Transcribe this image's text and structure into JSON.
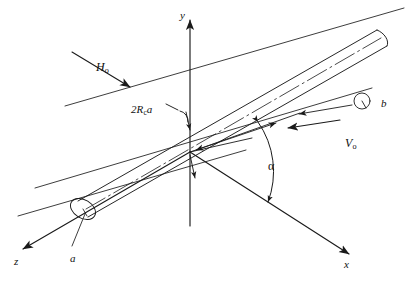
{
  "figure": {
    "type": "3d-technical-diagram",
    "background_color": "#ffffff",
    "line_color": "#1a1a1a",
    "width": 413,
    "height": 282
  },
  "axes": [
    {
      "id": "y",
      "label": "y",
      "direction": "up",
      "label_x": 180,
      "label_y": 10
    },
    {
      "id": "x",
      "label": "x",
      "direction": "lower-right",
      "label_x": 344,
      "label_y": 259
    },
    {
      "id": "z",
      "label": "z",
      "direction": "lower-left",
      "label_x": 14,
      "label_y": 256
    }
  ],
  "vectors": [
    {
      "id": "H0",
      "base": "H",
      "sub": "o",
      "label_x": 96,
      "label_y": 61
    },
    {
      "id": "V0",
      "base": "V",
      "sub": "o",
      "label_x": 345,
      "label_y": 137
    }
  ],
  "annotations": [
    {
      "id": "radius-a",
      "text": "a",
      "label_x": 70,
      "label_y": 253
    },
    {
      "id": "radius-b",
      "text": "b",
      "label_x": 381,
      "label_y": 98
    },
    {
      "id": "angle-alpha",
      "text": "α",
      "label_x": 268,
      "label_y": 160
    }
  ],
  "dimension": {
    "id": "core-diameter",
    "prefix": "2R",
    "sub": "c",
    "suffix": "a",
    "label_x": 131,
    "label_y": 104
  }
}
